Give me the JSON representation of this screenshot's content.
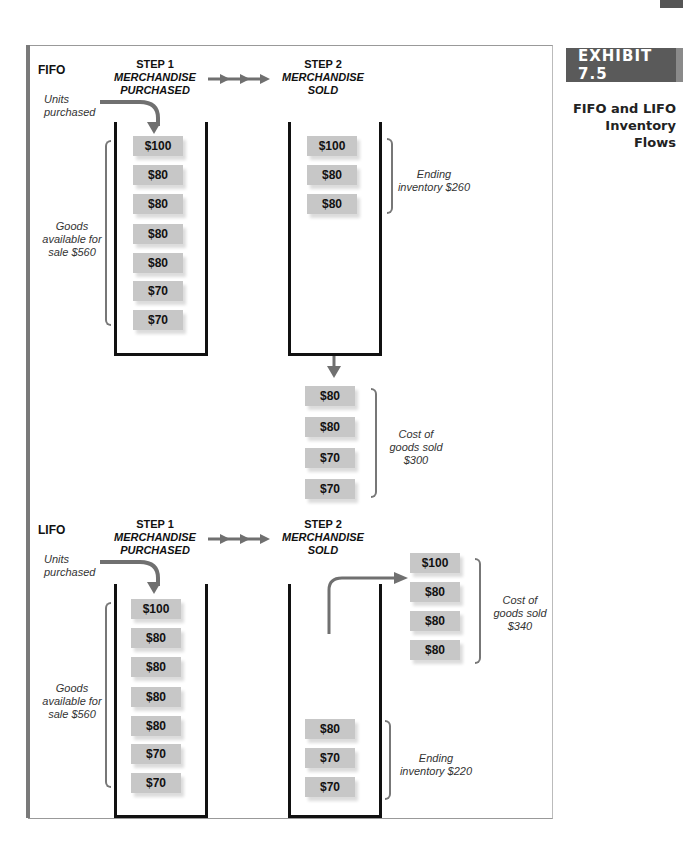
{
  "exhibit": {
    "badge": "EXHIBIT 7.5",
    "title_line1": "FIFO and LIFO",
    "title_line2": "Inventory Flows"
  },
  "fifo": {
    "method": "FIFO",
    "units_purchased_line1": "Units",
    "units_purchased_line2": "purchased",
    "step1": {
      "label": "STEP 1",
      "line1": "MERCHANDISE",
      "line2": "PURCHASED"
    },
    "step2": {
      "label": "STEP 2",
      "line1": "MERCHANDISE",
      "line2": "SOLD"
    },
    "goods_available": {
      "line1": "Goods",
      "line2": "available for",
      "line3": "sale $560"
    },
    "purchased_units": [
      "$100",
      "$80",
      "$80",
      "$80",
      "$80",
      "$70",
      "$70"
    ],
    "remaining_units": [
      "$100",
      "$80",
      "$80"
    ],
    "ending_inventory": {
      "line1": "Ending",
      "line2": "inventory $260"
    },
    "sold_units": [
      "$80",
      "$80",
      "$70",
      "$70"
    ],
    "cogs": {
      "line1": "Cost of",
      "line2": "goods sold",
      "line3": "$300"
    }
  },
  "lifo": {
    "method": "LIFO",
    "units_purchased_line1": "Units",
    "units_purchased_line2": "purchased",
    "step1": {
      "label": "STEP 1",
      "line1": "MERCHANDISE",
      "line2": "PURCHASED"
    },
    "step2": {
      "label": "STEP 2",
      "line1": "MERCHANDISE",
      "line2": "SOLD"
    },
    "goods_available": {
      "line1": "Goods",
      "line2": "available for",
      "line3": "sale $560"
    },
    "purchased_units": [
      "$100",
      "$80",
      "$80",
      "$80",
      "$80",
      "$70",
      "$70"
    ],
    "sold_units": [
      "$100",
      "$80",
      "$80",
      "$80"
    ],
    "cogs": {
      "line1": "Cost of",
      "line2": "goods sold",
      "line3": "$340"
    },
    "remaining_units": [
      "$80",
      "$70",
      "$70"
    ],
    "ending_inventory": {
      "line1": "Ending",
      "line2": "inventory $220"
    }
  },
  "colors": {
    "arrow": "#707070",
    "unit_box": "#c7c7c7",
    "badge": "#5a5a5a"
  }
}
